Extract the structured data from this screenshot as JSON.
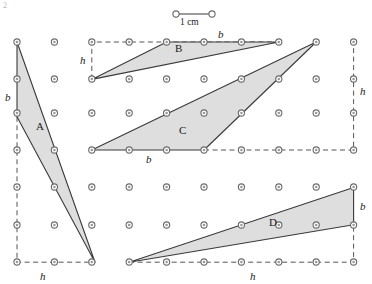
{
  "figure": {
    "width": 372,
    "height": 284,
    "background": "#ffffff",
    "corner_mark": "2"
  },
  "style": {
    "fill": "#d8d8d8",
    "fill_opacity": 0.85,
    "stroke": "#3a3a3a",
    "stroke_width": 1.1,
    "dash_stroke": "#555555",
    "dash_pattern": "5,3.5",
    "dot_outer": "#6b6b6b",
    "dot_inner": "#ffffff",
    "dot_radius": 3.1,
    "dot_inner_radius": 1.3,
    "text_color": "#1a1a1a"
  },
  "grid": {
    "description": "square dot lattice, 1 cm spacing",
    "spacing_px": 37.4,
    "cols_x": [
      17,
      54.4,
      91.8,
      129.2,
      166.6,
      204,
      241.4,
      278.8,
      316.2,
      353.6
    ],
    "rows_y": [
      42,
      79.4,
      116.8,
      150,
      187.4,
      224.8,
      262.2
    ],
    "rows_y_actual": [
      42,
      79,
      113,
      150,
      187,
      225,
      262
    ]
  },
  "scale_bar": {
    "label": "1 cm",
    "x1": 176,
    "x2": 212,
    "y": 14,
    "label_x": 180,
    "label_y": 18
  },
  "shapes": [
    {
      "name": "A",
      "label": "A",
      "label_x": 36,
      "label_y": 121,
      "points": "17,42 17,116.8 95,262.2",
      "base_label": "b",
      "base_label_x": 5,
      "base_label_y": 92,
      "height_label": "h",
      "height_label_x": 40,
      "height_label_y": 271,
      "dashed_base": "17,116.8 17,262.2 95,262.2"
    },
    {
      "name": "B",
      "label": "B",
      "label_x": 175,
      "label_y": 43,
      "points": "91.8,79.4 166.6,42 278.8,42",
      "base_label": "b",
      "base_label_x": 218,
      "base_label_y": 29,
      "height_label": "h",
      "height_label_x": 80,
      "height_label_y": 55,
      "dashed_base": "91.8,79.4 91.8,42 278.8,42"
    },
    {
      "name": "C",
      "label": "C",
      "label_x": 179,
      "label_y": 125,
      "points": "91.8,150 204,150 316.2,42",
      "base_label": "b",
      "base_label_x": 146,
      "base_label_y": 154,
      "height_label": "h",
      "height_label_x": 360,
      "height_label_y": 86,
      "dashed_base": "204,150 353.6,150 353.6,42"
    },
    {
      "name": "D",
      "label": "D",
      "label_x": 269,
      "label_y": 217,
      "points": "129.2,262.2 353.6,187.4 353.6,224.8",
      "base_label": "b",
      "base_label_x": 360,
      "base_label_y": 201,
      "height_label": "h",
      "height_label_x": 250,
      "height_label_y": 271,
      "dashed_base": "129.2,262.2 353.6,262.2 353.6,224.8"
    }
  ],
  "labels": {
    "shape_a": "A",
    "shape_b": "B",
    "shape_c": "C",
    "shape_d": "D",
    "base_a": "b",
    "base_b": "b",
    "base_c": "b",
    "base_d": "b",
    "height_a": "h",
    "height_b": "h",
    "height_c": "h",
    "height_d": "h",
    "scale": "1 cm"
  }
}
